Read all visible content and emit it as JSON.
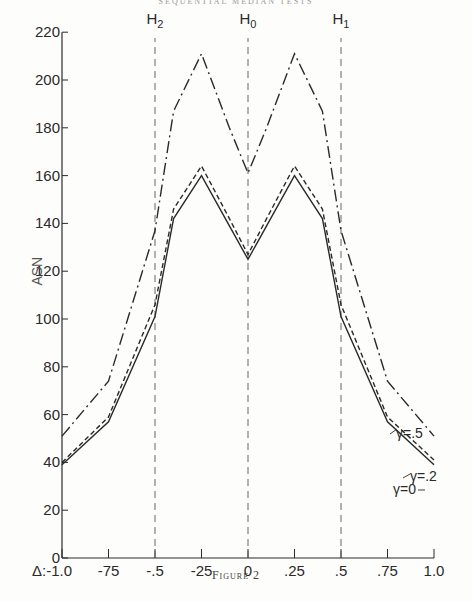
{
  "page": {
    "running_header": "SEQUENTIAL MEDIAN TESTS",
    "caption": "Figure 2"
  },
  "chart_data": {
    "type": "line",
    "title": "",
    "xlabel": "Δ",
    "ylabel": "ASN",
    "xlim": [
      -1.0,
      1.0
    ],
    "ylim": [
      0,
      220
    ],
    "x_tick_labels": [
      "Δ:-1.0",
      "-75",
      "-.5",
      "-25",
      "0",
      ".25",
      ".5",
      ".75",
      "1.0"
    ],
    "x_ticks": [
      -1.0,
      -0.75,
      -0.5,
      -0.25,
      0,
      0.25,
      0.5,
      0.75,
      1.0
    ],
    "y_ticks": [
      0,
      20,
      40,
      60,
      80,
      100,
      120,
      140,
      160,
      180,
      200,
      220
    ],
    "grid": false,
    "vertical_reference_lines": [
      {
        "x": -0.5,
        "label": "H2"
      },
      {
        "x": 0,
        "label": "H0"
      },
      {
        "x": 0.5,
        "label": "H1"
      }
    ],
    "x": [
      -1.0,
      -0.75,
      -0.5,
      -0.4,
      -0.25,
      -0.1,
      0,
      0.1,
      0.25,
      0.4,
      0.5,
      0.75,
      1.0
    ],
    "series": [
      {
        "name": "γ=0",
        "style": "solid",
        "values": [
          39,
          57,
          101,
          142,
          160,
          139,
          125,
          139,
          160,
          142,
          101,
          57,
          39
        ]
      },
      {
        "name": "γ=.2",
        "style": "dashed",
        "values": [
          40,
          59,
          106,
          146,
          164,
          142,
          127,
          142,
          164,
          146,
          106,
          59,
          41
        ]
      },
      {
        "name": "γ=.5",
        "style": "dash-dot",
        "values": [
          51,
          74,
          137,
          187,
          211,
          180,
          161,
          180,
          211,
          187,
          137,
          74,
          51
        ]
      }
    ],
    "annotations": [
      "H2",
      "H0",
      "H1",
      "γ=.5",
      "γ=.2",
      "γ=0"
    ]
  }
}
